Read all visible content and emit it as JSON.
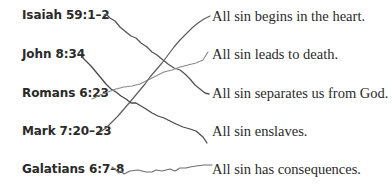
{
  "exercise": {
    "references": [
      {
        "label": "Isaiah 59:1–2"
      },
      {
        "label": "John 8:34"
      },
      {
        "label": "Romans 6:23"
      },
      {
        "label": "Mark 7:20–23"
      },
      {
        "label": "Galatians 6:7–8"
      }
    ],
    "statements": [
      {
        "label": "All sin begins in the heart."
      },
      {
        "label": "All sin leads to death."
      },
      {
        "label": "All sin separates us from God."
      },
      {
        "label": "All sin enslaves."
      },
      {
        "label": "All sin has consequences."
      }
    ],
    "connections": [
      {
        "from": "Isaiah 59:1–2",
        "to": "All sin separates us from God."
      },
      {
        "from": "John 8:34",
        "to": "All sin enslaves."
      },
      {
        "from": "Romans 6:23",
        "to": "All sin leads to death."
      },
      {
        "from": "Mark 7:20–23",
        "to": "All sin begins in the heart."
      },
      {
        "from": "Galatians 6:7–8",
        "to": "All sin has consequences."
      }
    ],
    "line_colors": {
      "dark": "#4a4a4a",
      "medium": "#6e6e6e",
      "light": "#8a8a8a"
    }
  }
}
